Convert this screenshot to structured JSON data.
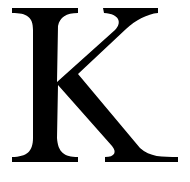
{
  "image": {
    "letter": "K",
    "description": "Serif capital letter K",
    "colors": {
      "background": "#ffffff",
      "glyph": "#000000"
    }
  }
}
